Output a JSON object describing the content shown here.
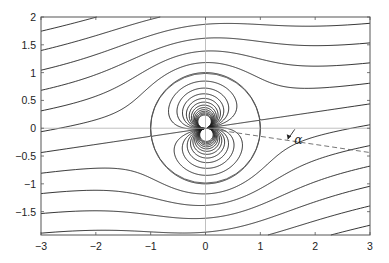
{
  "chart_data": {
    "type": "line",
    "subtype": "streamline-contour",
    "title": "",
    "xlabel": "",
    "ylabel": "",
    "xlim": [
      -3,
      3
    ],
    "ylim": [
      -1.92,
      2
    ],
    "xticks": [
      -3,
      -2,
      -1,
      0,
      1,
      2,
      3
    ],
    "xtick_labels": [
      "−3",
      "−2",
      "−1",
      "0",
      "1",
      "2",
      "3"
    ],
    "yticks": [
      2,
      1.5,
      1,
      0.5,
      0,
      -0.5,
      -1,
      -1.5
    ],
    "ytick_labels": [
      "2",
      "1.5",
      "1",
      "0.5",
      "0",
      "−0.5",
      "−1",
      "−1.5"
    ],
    "grid": false,
    "axis_lines": {
      "x0": true,
      "y0": true,
      "color": "#b0b0b0"
    },
    "stream_function": "psi = y'(1 - 1/r^2), y' = y cos(alpha) - x sin(alpha)",
    "alpha_deg": 8.3,
    "contour_spacing": 0.33,
    "contour_levels_min": -4.0,
    "contour_levels_max": 4.0,
    "left_edge_crossings_y": [
      1.77,
      1.52,
      1.21,
      0.88,
      0.58,
      0.23,
      -0.09,
      -0.42,
      -0.76,
      -1.1,
      -1.44,
      -1.79
    ],
    "circle": {
      "cx": 0,
      "cy": 0,
      "r": 1
    },
    "dashed_line": {
      "from": [
        0,
        0
      ],
      "angle_deg": -8.3
    },
    "annotation": {
      "text": "α",
      "x": 1.62,
      "y": -0.28,
      "arrow_to": [
        1.5,
        -0.2
      ]
    },
    "line_color": "#1a1a1a",
    "circle_color": "#555555"
  }
}
